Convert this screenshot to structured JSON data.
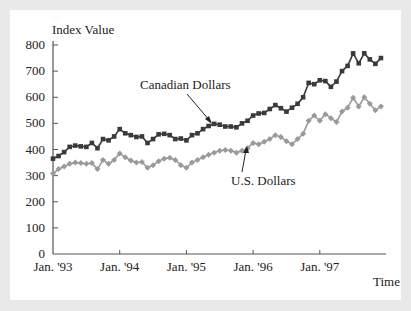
{
  "chart_data": {
    "type": "line",
    "title": "",
    "ylabel": "Index Value",
    "xlabel": "Time",
    "ylim": [
      0,
      800
    ],
    "yticks": [
      0,
      100,
      200,
      300,
      400,
      500,
      600,
      700,
      800
    ],
    "xtick_labels": [
      "Jan. '93",
      "Jan. '94",
      "Jan. '95",
      "Jan. '96",
      "Jan. '97"
    ],
    "x_start": "Jan. '93",
    "x_frequency": "monthly",
    "grid": false,
    "legend": "inline annotations",
    "series": [
      {
        "name": "Canadian Dollars",
        "color": "#3a3a3a",
        "marker": "square",
        "values": [
          365,
          375,
          390,
          410,
          415,
          412,
          410,
          425,
          405,
          440,
          435,
          450,
          478,
          462,
          455,
          448,
          450,
          425,
          440,
          458,
          460,
          455,
          440,
          442,
          435,
          455,
          462,
          478,
          490,
          498,
          495,
          488,
          488,
          485,
          500,
          510,
          530,
          538,
          540,
          555,
          570,
          558,
          545,
          560,
          575,
          600,
          655,
          650,
          665,
          662,
          640,
          660,
          700,
          720,
          768,
          730,
          768,
          745,
          728,
          750
        ]
      },
      {
        "name": "U.S. Dollars",
        "color": "#9a9a9a",
        "marker": "diamond",
        "values": [
          308,
          325,
          335,
          345,
          350,
          348,
          345,
          348,
          325,
          360,
          345,
          360,
          385,
          370,
          358,
          350,
          352,
          330,
          340,
          355,
          365,
          368,
          360,
          340,
          330,
          350,
          360,
          370,
          380,
          388,
          395,
          398,
          395,
          388,
          395,
          405,
          425,
          420,
          430,
          440,
          455,
          448,
          432,
          420,
          440,
          460,
          510,
          530,
          510,
          535,
          520,
          505,
          545,
          560,
          598,
          565,
          600,
          575,
          550,
          565
        ]
      }
    ],
    "annotations": [
      {
        "text": "Canadian Dollars",
        "points_to": "Canadian Dollars series near Apr. '95"
      },
      {
        "text": "U.S. Dollars",
        "points_to": "U.S. Dollars series near Dec. '95"
      }
    ]
  }
}
